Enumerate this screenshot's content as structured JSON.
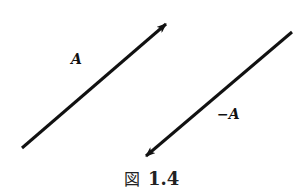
{
  "diagram": {
    "vectors": [
      {
        "name": "A",
        "label": "A",
        "from": [
          22,
          148
        ],
        "to": [
          168,
          22
        ]
      },
      {
        "name": "-A",
        "label": "−A",
        "from": [
          292,
          32
        ],
        "to": [
          144,
          158
        ]
      }
    ],
    "caption": {
      "prefix": "図",
      "number": "1.4"
    },
    "colors": {
      "stroke": "#111111",
      "background": "#ffffff"
    }
  }
}
